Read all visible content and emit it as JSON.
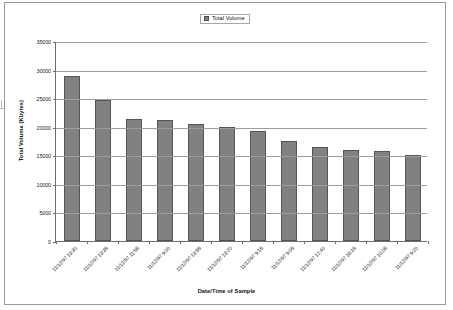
{
  "chart_data": {
    "type": "bar",
    "title": "",
    "xlabel": "Date/Time of Sample",
    "ylabel": "Total Volume (Kbytes)",
    "ylim": [
      0,
      35000
    ],
    "ytick_values": [
      0,
      5000,
      10000,
      15000,
      20000,
      25000,
      30000,
      35000
    ],
    "ytick_labels": [
      "0",
      "5000",
      "10000",
      "15000",
      "20000",
      "25000",
      "30000",
      "35000"
    ],
    "grid": true,
    "legend_position": "top-center",
    "legend_entries": [
      "Total Volume"
    ],
    "series": [
      {
        "name": "Total Volume",
        "color": "#818181",
        "values": [
          28800,
          24700,
          21300,
          21100,
          20500,
          20000,
          19250,
          17550,
          16400,
          15850,
          15700,
          15100
        ]
      }
    ],
    "categories": [
      "11/12/97 13:30",
      "11/12/97 13:35",
      "11/12/97 11:55",
      "11/12/97 9:00",
      "11/12/97 13:55",
      "11/12/97 13:20",
      "11/12/97 9:15",
      "11/12/97 9:05",
      "11/12/97 12:40",
      "11/12/97 16:15",
      "11/12/97 10:05",
      "11/12/97 9:20"
    ]
  },
  "legend": {
    "label": "Total Volume"
  },
  "axes": {
    "x_title": "Date/Time of Sample",
    "y_title": "Total Volume (Kbytes)"
  }
}
